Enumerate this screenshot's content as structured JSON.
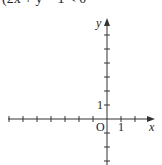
{
  "problem": {
    "inequality_text": "(2x + y − 1 < 0"
  },
  "graph": {
    "x_axis_label": "x",
    "y_axis_label": "y",
    "origin_label": "O",
    "x_unit_label": "1",
    "y_unit_label": "1",
    "axis_color": "#333333",
    "unit_px": 14,
    "origin_px": [
      107,
      119
    ],
    "x_ticks": [
      -7,
      -6,
      -5,
      -4,
      -3,
      -2,
      -1,
      1,
      2
    ],
    "y_ticks": [
      -3,
      -2,
      -1,
      1,
      2,
      3,
      4,
      5,
      6
    ]
  }
}
